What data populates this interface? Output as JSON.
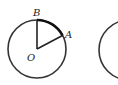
{
  "diagram": {
    "figure1": {
      "labels": {
        "center": "O",
        "pointA": "A",
        "pointB": "B"
      },
      "circle": {
        "cx": 37,
        "cy": 49,
        "r": 29
      },
      "points": {
        "O": [
          37,
          49
        ],
        "A": [
          62,
          36
        ],
        "B": [
          37,
          20
        ]
      }
    },
    "figure2": {
      "circle": {
        "cx": 129,
        "cy": 50,
        "r": 30
      }
    },
    "colors": {
      "stroke": "#333333",
      "arc": "#111111"
    }
  }
}
